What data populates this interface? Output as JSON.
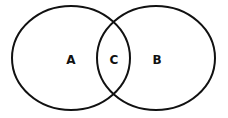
{
  "diagram": {
    "type": "venn",
    "stroke_color": "#111111",
    "background": "#ffffff",
    "sets": [
      {
        "id": "A",
        "label": "A",
        "cx": 71,
        "cy": 58,
        "rx": 59,
        "ry": 52
      },
      {
        "id": "B",
        "label": "B",
        "cx": 156,
        "cy": 58,
        "rx": 59,
        "ry": 52
      }
    ],
    "intersection": {
      "label": "C",
      "x": 114,
      "y": 60
    },
    "labels": {
      "a": "A",
      "b": "B",
      "c": "C"
    }
  }
}
